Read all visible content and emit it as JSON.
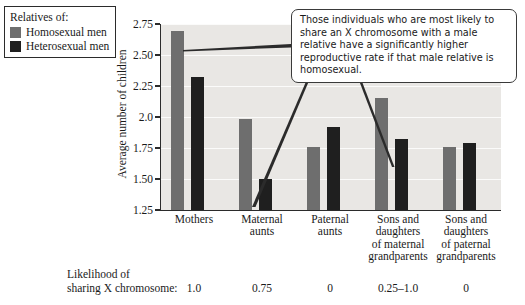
{
  "legend": {
    "title": "Relatives of:",
    "items": [
      {
        "label": "Homosexual men",
        "color": "#6e6e6e",
        "swatch": "legend-swatch-homosexual"
      },
      {
        "label": "Heterosexual men",
        "color": "#1f1f1f",
        "swatch": "legend-swatch-heterosexual"
      }
    ]
  },
  "callout": {
    "text": "Those individuals who are most likely to share an X chromosome with a male relative have a significantly higher reproductive rate if that male relative is homosexual."
  },
  "likelihood": {
    "label_line1": "Likelihood of",
    "label_line2": "sharing X chromosome:",
    "values": [
      "1.0",
      "0.75",
      "0",
      "0.25–1.0",
      "0"
    ]
  },
  "chart_data": {
    "type": "bar",
    "title": "",
    "xlabel": "",
    "ylabel": "Average number of children",
    "ylim": [
      1.25,
      2.75
    ],
    "yticks": [
      1.25,
      1.5,
      1.75,
      2.0,
      2.25,
      2.5,
      2.75
    ],
    "ytick_labels": [
      "1.25",
      "1.50",
      "1.75",
      "2.0",
      "2.25",
      "2.50",
      "2.75"
    ],
    "grid": true,
    "legend_position": "top-left-outside",
    "categories": [
      "Mothers",
      "Maternal aunts",
      "Paternal aunts",
      "Sons and daughters of maternal grandparents",
      "Sons and daughters of paternal grandparents"
    ],
    "category_lines": [
      [
        "Mothers"
      ],
      [
        "Maternal",
        "aunts"
      ],
      [
        "Paternal",
        "aunts"
      ],
      [
        "Sons and",
        "daughters",
        "of maternal",
        "grandparents"
      ],
      [
        "Sons and",
        "daughters",
        "of paternal",
        "grandparents"
      ]
    ],
    "series": [
      {
        "name": "Homosexual men",
        "color": "#6e6e6e",
        "values": [
          2.69,
          1.98,
          1.76,
          2.15,
          1.76
        ]
      },
      {
        "name": "Heterosexual men",
        "color": "#1f1f1f",
        "values": [
          2.32,
          1.5,
          1.92,
          1.82,
          1.79
        ]
      }
    ]
  }
}
